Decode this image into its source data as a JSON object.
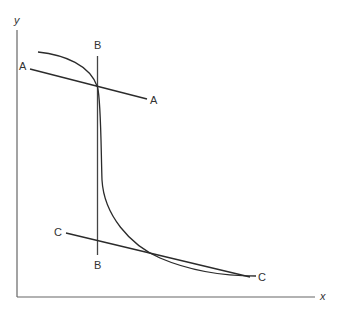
{
  "axes": {
    "x_label": "x",
    "y_label": "y"
  },
  "lines": {
    "A": {
      "left_label": "A",
      "right_label": "A"
    },
    "B": {
      "top_label": "B",
      "bottom_label": "B"
    },
    "C": {
      "left_label": "C",
      "right_label": "C"
    }
  },
  "colors": {
    "stroke": "#2b2b2b",
    "axis": "#555555"
  }
}
